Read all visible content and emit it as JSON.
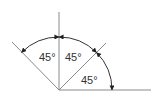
{
  "diagram": {
    "type": "angle-diagram",
    "colors": {
      "lines": "#8a8a8a",
      "arcs": "#333333",
      "text": "#333333"
    },
    "angles": [
      {
        "id": "left",
        "label": "45°"
      },
      {
        "id": "middle",
        "label": "45°"
      },
      {
        "id": "right",
        "label": "45°"
      }
    ]
  }
}
